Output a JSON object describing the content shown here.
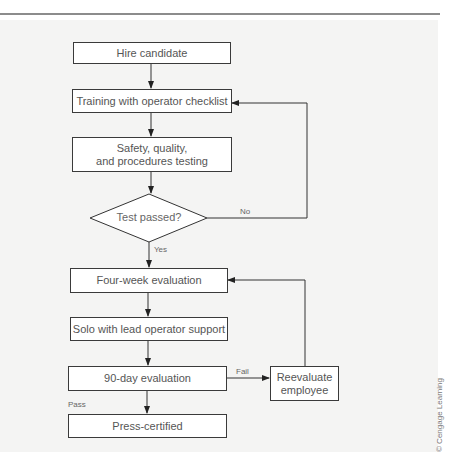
{
  "flowchart": {
    "nodes": [
      {
        "id": "hire",
        "type": "process",
        "label": "Hire candidate"
      },
      {
        "id": "training",
        "type": "process",
        "label": "Training with operator checklist"
      },
      {
        "id": "testing",
        "type": "process",
        "label": "Safety, quality,\nand procedures testing"
      },
      {
        "id": "test_passed",
        "type": "decision",
        "label": "Test passed?"
      },
      {
        "id": "four_week",
        "type": "process",
        "label": "Four-week evaluation"
      },
      {
        "id": "solo",
        "type": "process",
        "label": "Solo with lead operator support"
      },
      {
        "id": "ninety_day",
        "type": "process",
        "label": "90-day evaluation"
      },
      {
        "id": "reevaluate",
        "type": "process",
        "label": "Reevaluate\nemployee"
      },
      {
        "id": "certified",
        "type": "process",
        "label": "Press-certified"
      }
    ],
    "edges": [
      {
        "from": "hire",
        "to": "training",
        "label": ""
      },
      {
        "from": "training",
        "to": "testing",
        "label": ""
      },
      {
        "from": "testing",
        "to": "test_passed",
        "label": ""
      },
      {
        "from": "test_passed",
        "to": "training",
        "label": "No"
      },
      {
        "from": "test_passed",
        "to": "four_week",
        "label": "Yes"
      },
      {
        "from": "four_week",
        "to": "solo",
        "label": ""
      },
      {
        "from": "solo",
        "to": "ninety_day",
        "label": ""
      },
      {
        "from": "ninety_day",
        "to": "reevaluate",
        "label": "Fail"
      },
      {
        "from": "reevaluate",
        "to": "four_week",
        "label": ""
      },
      {
        "from": "ninety_day",
        "to": "certified",
        "label": "Pass"
      }
    ],
    "labels": {
      "hire": "Hire candidate",
      "training": "Training with operator checklist",
      "testing_line1": "Safety, quality,",
      "testing_line2": "and procedures testing",
      "test_passed": "Test passed?",
      "no": "No",
      "yes": "Yes",
      "four_week": "Four-week evaluation",
      "solo": "Solo with lead operator support",
      "ninety_day": "90-day evaluation",
      "fail": "Fail",
      "reevaluate_line1": "Reevaluate",
      "reevaluate_line2": "employee",
      "pass": "Pass",
      "certified": "Press-certified"
    }
  },
  "credit": "© Cengage Learning"
}
